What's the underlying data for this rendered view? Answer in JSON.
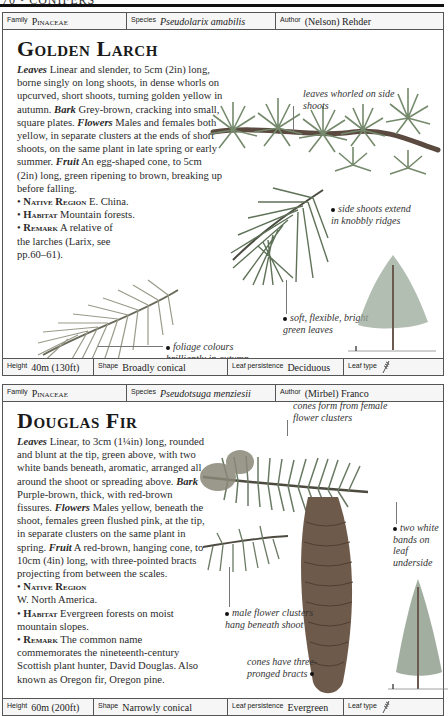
{
  "page": {
    "running_head": "70 • CONIFERS"
  },
  "entries": [
    {
      "header": {
        "family_label": "Family",
        "family_value": "Pinaceae",
        "species_label": "Species",
        "species_value": "Pseudolarix amabilis",
        "author_label": "Author",
        "author_value": "(Nelson) Rehder"
      },
      "title": "Golden Larch",
      "description": {
        "leaves_h": "Leaves",
        "leaves": "Linear and slender, to 5cm (2in) long, borne singly on long shoots, in dense whorls on upcurved, short shoots, turning golden yellow in autumn.",
        "bark_h": "Bark",
        "bark": "Grey-brown, cracking into small, square plates.",
        "flowers_h": "Flowers",
        "flowers": "Males and females both yellow, in separate clusters at the ends of short shoots, on the same plant in late spring or early summer.",
        "fruit_h": "Fruit",
        "fruit": "An egg-shaped cone, to 5cm (2in) long, green ripening to brown, breaking up before falling."
      },
      "bullets": [
        {
          "heading": "Native Region",
          "text": "E. China."
        },
        {
          "heading": "Habitat",
          "text": "Mountain forests."
        },
        {
          "heading": "Remark",
          "text": "A relative of the larches (Larix, see pp.60–61)."
        }
      ],
      "captions": [
        "leaves whorled on side shoots",
        "side shoots extend in knobbly ridges",
        "soft, flexible, bright green leaves",
        "foliage colours brilliantly in autumn"
      ],
      "footer": {
        "height_label": "Height",
        "height_value": "40m (130ft)",
        "shape_label": "Shape",
        "shape_value": "Broadly conical",
        "persistence_label": "Leaf persistence",
        "persistence_value": "Deciduous",
        "leaftype_label": "Leaf type",
        "leaftype_icon": "needle-leaf-icon"
      }
    },
    {
      "header": {
        "family_label": "Family",
        "family_value": "Pinaceae",
        "species_label": "Species",
        "species_value": "Pseudotsuga menziesii",
        "author_label": "Author",
        "author_value": "(Mirbel) Franco"
      },
      "title": "Douglas Fir",
      "description": {
        "leaves_h": "Leaves",
        "leaves": "Linear, to 3cm (1¼in) long, rounded and blunt at the tip, green above, with two white bands beneath, aromatic, arranged all around the shoot or spreading above.",
        "bark_h": "Bark",
        "bark": "Purple-brown, thick, with red-brown fissures.",
        "flowers_h": "Flowers",
        "flowers": "Males yellow, beneath the shoot, females green flushed pink, at the tip, in separate clusters on the same plant in spring.",
        "fruit_h": "Fruit",
        "fruit": "A red-brown, hanging cone, to 10cm (4in) long, with three-pointed bracts projecting from between the scales."
      },
      "bullets": [
        {
          "heading": "Native Region",
          "text": "W. North America."
        },
        {
          "heading": "Habitat",
          "text": "Evergreen forests on moist mountain slopes."
        },
        {
          "heading": "Remark",
          "text": "The common name commemorates the nineteenth-century Scottish plant hunter, David Douglas. Also known as Oregon fir, Oregon pine."
        }
      ],
      "captions": [
        "cones form from female flower clusters",
        "two white bands on leaf underside",
        "male flower clusters hang beneath shoot",
        "cones have three-pronged bracts"
      ],
      "footer": {
        "height_label": "Height",
        "height_value": "60m (200ft)",
        "shape_label": "Shape",
        "shape_value": "Narrowly conical",
        "persistence_label": "Leaf persistence",
        "persistence_value": "Evergreen",
        "leaftype_label": "Leaf type",
        "leaftype_icon": "needle-leaf-icon"
      }
    }
  ],
  "colors": {
    "rule": "#111111",
    "border": "#555555",
    "bar_bg": "#f6f6f6",
    "foliage_green": "#6f7f66",
    "cone_brown": "#6e5a4a"
  }
}
